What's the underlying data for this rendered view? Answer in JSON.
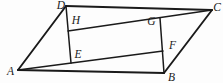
{
  "figure": {
    "type": "geometry-diagram",
    "ink_color": "#1a1a1a",
    "background_color": "#fdfdfd",
    "points": {
      "A": {
        "x": 18,
        "y": 70,
        "lx": 10.5,
        "ly": 74.5
      },
      "B": {
        "x": 164,
        "y": 73,
        "lx": 171.5,
        "ly": 80.5
      },
      "C": {
        "x": 212,
        "y": 10,
        "lx": 217,
        "ly": 10.5
      },
      "D": {
        "x": 66,
        "y": 6,
        "lx": 61,
        "ly": 8.5
      },
      "E": {
        "x": 71,
        "y": 63,
        "lx": 78,
        "ly": 58
      },
      "F": {
        "x": 163,
        "y": 51,
        "lx": 172.5,
        "ly": 49
      },
      "G": {
        "x": 160,
        "y": 18,
        "lx": 151.5,
        "ly": 24.5
      },
      "H": {
        "x": 68,
        "y": 31,
        "lx": 76,
        "ly": 23.5
      }
    },
    "segments": [
      {
        "from": "A",
        "to": "B",
        "kind": "outer"
      },
      {
        "from": "B",
        "to": "C",
        "kind": "outer"
      },
      {
        "from": "C",
        "to": "D",
        "kind": "outer"
      },
      {
        "from": "D",
        "to": "A",
        "kind": "outer"
      },
      {
        "from": "A",
        "to": "F",
        "kind": "inner"
      },
      {
        "from": "B",
        "to": "G",
        "kind": "inner"
      },
      {
        "from": "C",
        "to": "H",
        "kind": "inner"
      },
      {
        "from": "D",
        "to": "E",
        "kind": "inner"
      }
    ]
  }
}
